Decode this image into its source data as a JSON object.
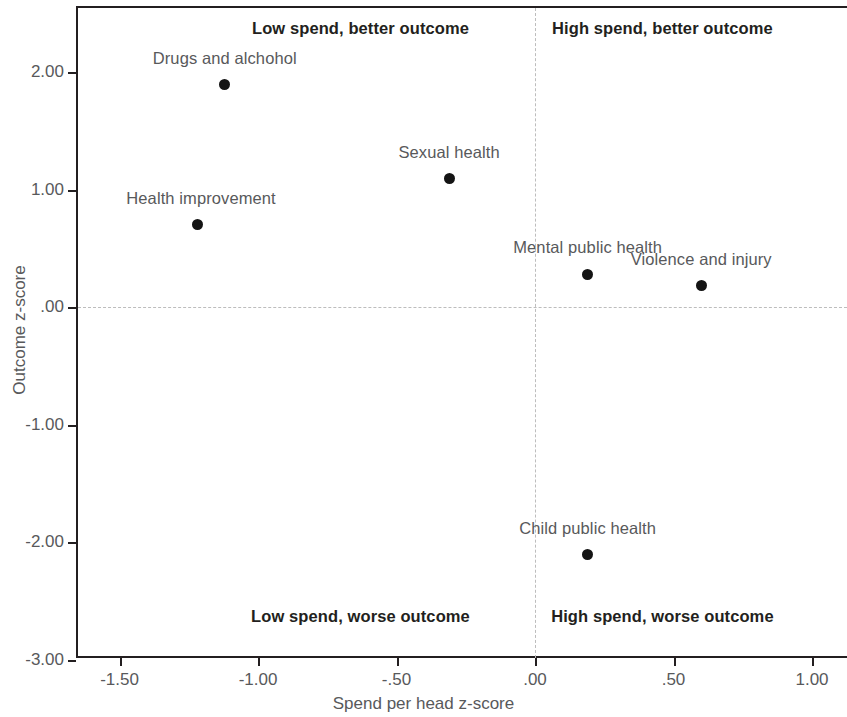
{
  "chart_data": {
    "type": "scatter",
    "title": "",
    "xlabel": "Spend per head z-score",
    "ylabel": "Outcome z-score",
    "xlim": [
      -1.66,
      1.12
    ],
    "ylim": [
      -3.0,
      2.55
    ],
    "grid": false,
    "legend": "none",
    "reference_lines": {
      "x": 0.0,
      "y": 0.0,
      "style": "dashed",
      "color": "#bdbdbd"
    },
    "xticks": [
      -1.5,
      -1.0,
      -0.5,
      0.0,
      0.5,
      1.0
    ],
    "xticklabels": [
      "-1.50",
      "-1.00",
      "-.50",
      ".00",
      ".50",
      "1.00"
    ],
    "yticks": [
      2.0,
      1.0,
      0.0,
      -1.0,
      -2.0,
      -3.0
    ],
    "yticklabels": [
      "2.00",
      "1.00",
      ".00",
      "-1.00",
      "-2.00",
      "-3.00"
    ],
    "point_color": "#141414",
    "points": [
      {
        "label": "Drugs and alchohol",
        "x": -1.12,
        "y": 1.89,
        "label_dx": 0,
        "label_dy": -27
      },
      {
        "label": "Health improvement",
        "x": -1.22,
        "y": 0.7,
        "label_dx": 4,
        "label_dy": -27
      },
      {
        "label": "Sexual health",
        "x": -0.31,
        "y": 1.09,
        "label_dx": 0,
        "label_dy": -27
      },
      {
        "label": "Mental public health",
        "x": 0.19,
        "y": 0.28,
        "label_dx": 0,
        "label_dy": -27
      },
      {
        "label": "Violence and injury",
        "x": 0.6,
        "y": 0.18,
        "label_dx": 0,
        "label_dy": -27
      },
      {
        "label": "Child public health",
        "x": 0.19,
        "y": -2.11,
        "label_dx": 0,
        "label_dy": -27
      }
    ],
    "quadrant_labels": [
      {
        "text": "Low spend, better outcome",
        "x": -0.63,
        "y": 2.37
      },
      {
        "text": "High spend, better outcome",
        "x": 0.46,
        "y": 2.37
      },
      {
        "text": "Low spend, worse outcome",
        "x": -0.63,
        "y": -2.64
      },
      {
        "text": "High spend, worse outcome",
        "x": 0.46,
        "y": -2.64
      }
    ]
  },
  "axes": {
    "x_title": "Spend per head z-score",
    "y_title": "Outcome z-score"
  }
}
